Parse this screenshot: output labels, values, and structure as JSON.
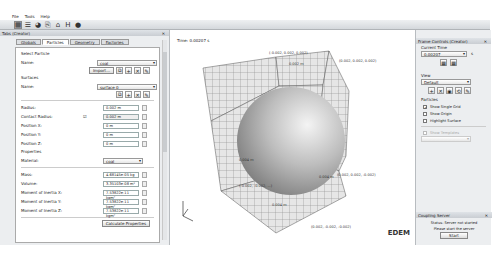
{
  "menu": [
    "File",
    "Tools",
    "Help"
  ],
  "toolbar": {
    "buttons": [
      {
        "name": "creator-icon",
        "glyph": "▦",
        "active": true
      },
      {
        "name": "simulator-icon",
        "glyph": "☰"
      },
      {
        "name": "analyst-icon",
        "glyph": "◕"
      },
      {
        "name": "open-icon",
        "glyph": "⎘"
      },
      {
        "name": "export-icon",
        "glyph": "⌂"
      },
      {
        "name": "save-icon",
        "glyph": "H"
      },
      {
        "name": "help-icon",
        "glyph": "●"
      }
    ]
  },
  "left_panel": {
    "title": "Tabs (Creator)",
    "tabs": [
      "Globals",
      "Particles",
      "Geometry",
      "Factories"
    ],
    "selected_tab": "Particles",
    "select_particle_label": "Select Particle",
    "name_label": "Name:",
    "particle_name": "coal",
    "import_label": "Import...",
    "surfaces_label": "Surfaces",
    "surface_name_label": "Name:",
    "surface_name": "surface 0",
    "fields": [
      {
        "label": "Radius:",
        "value": "0.002 m"
      },
      {
        "label": "Contact Radius:",
        "value": "0.002 m",
        "check": true
      },
      {
        "label": "Position X:",
        "value": "0 m"
      },
      {
        "label": "Position Y:",
        "value": "0 m"
      },
      {
        "label": "Position Z:",
        "value": "0 m"
      }
    ],
    "properties_label": "Properties",
    "material_label": "Material:",
    "material": "coal",
    "props": [
      {
        "label": "Mass:",
        "value": "4.68145e-05 kg"
      },
      {
        "label": "Volume:",
        "value": "3.35103e-08 m³"
      },
      {
        "label": "Moment of Inertia X:",
        "value": "7.53822e-11 kgm²"
      },
      {
        "label": "Moment of Inertia Y:",
        "value": "7.53822e-11 kgm²"
      },
      {
        "label": "Moment of Inertia Z:",
        "value": "7.53822e-11 kgm²"
      }
    ],
    "calc_button": "Calculate Properties"
  },
  "viewer": {
    "time": "Time: 0.00207 s",
    "coords": {
      "top_left": "(-0.002, 0.002, 0.002)",
      "top_right": "(0.002, 0.002, 0.002)",
      "mid_right": "(0.002, 0.002, -0.002)",
      "bottom_left": "(-0.002, -0.002, ...)",
      "bottom_right": "(0.002, -0.002, -0.002)",
      "label_top": "0.002 m",
      "label_left": "0.004 m",
      "label_right": "0.004 m",
      "label_bottom": "0.004 m"
    },
    "logo": "EDEM"
  },
  "right_panel": {
    "title": "Frame Controls (Creator)",
    "current_time_label": "Current Time",
    "current_time": "0.00207",
    "time_unit": "s",
    "view_label": "View",
    "view_value": "Default",
    "particles_label": "Particles",
    "checkboxes": [
      {
        "label": "Show Single Grid",
        "checked": true
      },
      {
        "label": "Show Origin",
        "checked": false
      },
      {
        "label": "Highlight Surface",
        "checked": false
      }
    ],
    "show_templates": "Show Templates",
    "coupling_title": "Coupling Server",
    "status": "Status: Server not started",
    "status2": "Please start the server",
    "start_button": "Start"
  }
}
